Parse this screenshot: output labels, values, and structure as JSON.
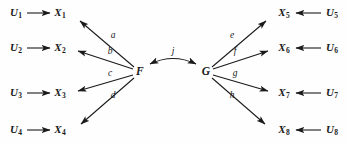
{
  "diagram": {
    "background_color": "#fefefe",
    "stroke_color": "#1a1a1a",
    "left_factor": {
      "name": "F",
      "x": 140,
      "y": 72
    },
    "right_factor": {
      "name": "G",
      "x": 206,
      "y": 72
    },
    "factor_correlation": {
      "label": "j",
      "label_x": 173,
      "label_y": 52,
      "arrow_type": "double-headed-curved"
    },
    "left_rows": [
      {
        "disturbance": "U",
        "disturbance_sub": "1",
        "indicator": "X",
        "indicator_sub": "1",
        "loading": "a",
        "y": 13,
        "u_x": 16,
        "x_x": 60,
        "u_arrow_x1": 27,
        "u_arrow_x2": 50,
        "f_arrow_tip_x": 80,
        "f_arrow_tip_y": 21,
        "label_x": 113,
        "label_y": 36
      },
      {
        "disturbance": "U",
        "disturbance_sub": "2",
        "indicator": "X",
        "indicator_sub": "2",
        "loading": "b",
        "y": 48,
        "u_x": 16,
        "x_x": 60,
        "u_arrow_x1": 27,
        "u_arrow_x2": 50,
        "f_arrow_tip_x": 78,
        "f_arrow_tip_y": 51,
        "label_x": 110,
        "label_y": 52
      },
      {
        "disturbance": "U",
        "disturbance_sub": "3",
        "indicator": "X",
        "indicator_sub": "3",
        "loading": "c",
        "y": 93,
        "u_x": 16,
        "x_x": 60,
        "u_arrow_x1": 27,
        "u_arrow_x2": 50,
        "f_arrow_tip_x": 78,
        "f_arrow_tip_y": 91,
        "label_x": 110,
        "label_y": 74
      },
      {
        "disturbance": "U",
        "disturbance_sub": "4",
        "indicator": "X",
        "indicator_sub": "4",
        "loading": "d",
        "y": 130,
        "u_x": 16,
        "x_x": 60,
        "u_arrow_x1": 27,
        "u_arrow_x2": 50,
        "f_arrow_tip_x": 81,
        "f_arrow_tip_y": 124,
        "label_x": 113,
        "label_y": 96
      }
    ],
    "right_rows": [
      {
        "disturbance": "U",
        "disturbance_sub": "5",
        "indicator": "X",
        "indicator_sub": "5",
        "loading": "e",
        "y": 13,
        "u_x": 332,
        "x_x": 284,
        "u_arrow_x1": 321,
        "u_arrow_x2": 296,
        "g_arrow_tip_x": 266,
        "g_arrow_tip_y": 21,
        "label_x": 232,
        "label_y": 36
      },
      {
        "disturbance": "U",
        "disturbance_sub": "6",
        "indicator": "X",
        "indicator_sub": "6",
        "loading": "f",
        "y": 48,
        "u_x": 332,
        "x_x": 284,
        "u_arrow_x1": 321,
        "u_arrow_x2": 296,
        "g_arrow_tip_x": 268,
        "g_arrow_tip_y": 51,
        "label_x": 235,
        "label_y": 52
      },
      {
        "disturbance": "U",
        "disturbance_sub": "7",
        "indicator": "X",
        "indicator_sub": "7",
        "loading": "g",
        "y": 93,
        "u_x": 332,
        "x_x": 284,
        "u_arrow_x1": 321,
        "u_arrow_x2": 296,
        "g_arrow_tip_x": 268,
        "g_arrow_tip_y": 91,
        "label_x": 235,
        "label_y": 74
      },
      {
        "disturbance": "U",
        "disturbance_sub": "8",
        "indicator": "X",
        "indicator_sub": "8",
        "loading": "h",
        "y": 130,
        "u_x": 332,
        "x_x": 284,
        "u_arrow_x1": 321,
        "u_arrow_x2": 296,
        "g_arrow_tip_x": 265,
        "g_arrow_tip_y": 124,
        "label_x": 232,
        "label_y": 96
      }
    ]
  }
}
